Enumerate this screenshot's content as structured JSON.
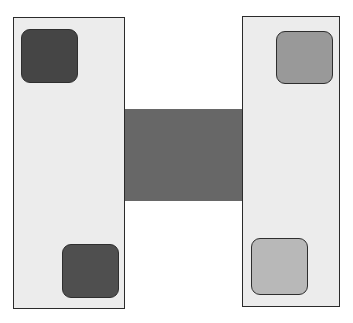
{
  "diagram": {
    "colors": {
      "background": "#ffffff",
      "panel_fill": "#ececec",
      "outline": "#2b2b2b",
      "connector_fill": "#676767",
      "dark_square_fill": "#454545",
      "mid_square_fill": "#999999",
      "light_square_fill": "#b8b8b8"
    },
    "panels": [
      {
        "id": "left",
        "x": 13,
        "y": 17,
        "w": 112,
        "h": 292,
        "squares": [
          {
            "id": "top-left",
            "x": 21,
            "y": 29,
            "w": 57,
            "h": 54,
            "fill": "#454545"
          },
          {
            "id": "bottom-left",
            "x": 62,
            "y": 244,
            "w": 57,
            "h": 54,
            "fill": "#4f4f4f"
          }
        ]
      },
      {
        "id": "right",
        "x": 242,
        "y": 16,
        "w": 98,
        "h": 291,
        "squares": [
          {
            "id": "top-right",
            "x": 276,
            "y": 31,
            "w": 57,
            "h": 53,
            "fill": "#999999"
          },
          {
            "id": "bottom-right",
            "x": 251,
            "y": 238,
            "w": 57,
            "h": 57,
            "fill": "#b8b8b8"
          }
        ]
      }
    ],
    "connector": {
      "x": 125,
      "y": 109,
      "w": 117,
      "h": 92,
      "fill": "#676767"
    }
  }
}
